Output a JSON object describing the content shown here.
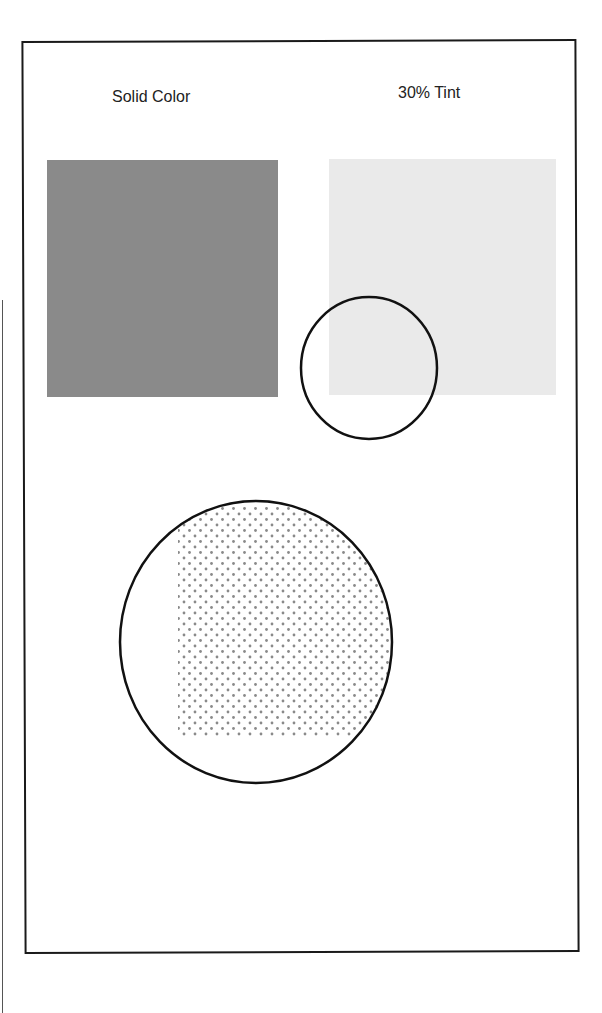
{
  "labels": {
    "solid": "Solid Color",
    "tint": "30% Tint"
  },
  "colors": {
    "solid": "#8a8a8a",
    "tint": "#eaeaea",
    "dot": "#8a8a8a",
    "outline": "#111111"
  },
  "shapes": {
    "solid_square": {
      "x": 47,
      "y": 160,
      "w": 231,
      "h": 237
    },
    "tint_square": {
      "x": 329,
      "y": 159,
      "w": 227,
      "h": 236
    },
    "small_circle": {
      "cx": 369,
      "cy": 368,
      "rx": 68,
      "ry": 71
    },
    "dot_region": {
      "x": 178,
      "y": 505,
      "w": 212,
      "h": 232
    },
    "large_circle": {
      "cx": 256,
      "cy": 642,
      "rx": 136,
      "ry": 141
    }
  }
}
